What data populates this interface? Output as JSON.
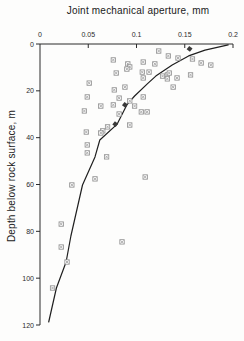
{
  "chart_data": {
    "type": "scatter",
    "title": "Joint mechanical aperture,  mm",
    "xlabel": "Joint mechanical aperture, mm",
    "ylabel": "Depth below rock surface,  m",
    "xlim": [
      0,
      0.2
    ],
    "ylim": [
      0,
      120
    ],
    "x_axis_position": "top",
    "y_axis_inverted": true,
    "grid": false,
    "legend": null,
    "x_ticks": [
      0,
      0.05,
      0.1,
      0.15,
      0.2
    ],
    "x_tick_labels": [
      "0",
      "0.05",
      "0.1",
      "0.15",
      "0.2"
    ],
    "y_ticks": [
      0,
      20,
      40,
      60,
      80,
      100,
      120
    ],
    "y_tick_labels": [
      "0",
      "20",
      "40",
      "60",
      "80",
      "100",
      "120"
    ],
    "style": {
      "axis_color": "#2b2b2b",
      "tick_label_color": "#2b2b2b",
      "marker_color": "#8f8f8f",
      "marker_fill": "#ffffff",
      "dark_marker_color": "#3a3a3a",
      "curve_color": "#1f1f1f",
      "background": "#fdfdfc"
    },
    "series": [
      {
        "name": "measured-aperture-points",
        "marker": "crossed-square",
        "points": [
          [
            0.123,
            3.0
          ],
          [
            0.133,
            5.1
          ],
          [
            0.143,
            6.0
          ],
          [
            0.158,
            6.4
          ],
          [
            0.167,
            8.1
          ],
          [
            0.177,
            9.0
          ],
          [
            0.156,
            13.2
          ],
          [
            0.076,
            6.8
          ],
          [
            0.091,
            8.5
          ],
          [
            0.093,
            9.8
          ],
          [
            0.09,
            10.7
          ],
          [
            0.107,
            7.7
          ],
          [
            0.119,
            8.5
          ],
          [
            0.079,
            12.4
          ],
          [
            0.106,
            12.0
          ],
          [
            0.113,
            12.0
          ],
          [
            0.107,
            14.5
          ],
          [
            0.127,
            13.7
          ],
          [
            0.132,
            13.2
          ],
          [
            0.134,
            12.4
          ],
          [
            0.132,
            14.9
          ],
          [
            0.142,
            14.5
          ],
          [
            0.051,
            16.7
          ],
          [
            0.088,
            18.4
          ],
          [
            0.077,
            19.6
          ],
          [
            0.138,
            18.4
          ],
          [
            0.049,
            22.6
          ],
          [
            0.082,
            23.1
          ],
          [
            0.093,
            24.3
          ],
          [
            0.107,
            22.6
          ],
          [
            0.063,
            26.5
          ],
          [
            0.076,
            26.0
          ],
          [
            0.098,
            26.5
          ],
          [
            0.046,
            28.6
          ],
          [
            0.105,
            29.0
          ],
          [
            0.111,
            29.0
          ],
          [
            0.082,
            29.9
          ],
          [
            0.065,
            37.1
          ],
          [
            0.07,
            35.4
          ],
          [
            0.093,
            34.6
          ],
          [
            0.048,
            37.6
          ],
          [
            0.063,
            38.0
          ],
          [
            0.049,
            43.1
          ],
          [
            0.049,
            46.5
          ],
          [
            0.069,
            48.2
          ],
          [
            0.109,
            56.8
          ],
          [
            0.057,
            57.6
          ],
          [
            0.033,
            60.2
          ],
          [
            0.022,
            76.9
          ],
          [
            0.085,
            84.5
          ],
          [
            0.022,
            86.7
          ],
          [
            0.028,
            93.1
          ],
          [
            0.013,
            104.2
          ]
        ]
      },
      {
        "name": "curve-anchor-points",
        "marker": "filled-square",
        "points": [
          [
            0.155,
            2.1
          ],
          [
            0.088,
            26.0
          ],
          [
            0.078,
            34.2
          ]
        ]
      }
    ],
    "fit_curve": {
      "name": "aperture-depth-fit-curve",
      "points": [
        [
          0.009,
          118.7
        ],
        [
          0.017,
          104.2
        ],
        [
          0.027,
          93.1
        ],
        [
          0.032,
          82.0
        ],
        [
          0.044,
          60.2
        ],
        [
          0.057,
          48.2
        ],
        [
          0.062,
          41.0
        ],
        [
          0.08,
          34.2
        ],
        [
          0.09,
          26.0
        ],
        [
          0.098,
          22.2
        ],
        [
          0.112,
          16.7
        ],
        [
          0.12,
          13.7
        ],
        [
          0.137,
          9.0
        ],
        [
          0.154,
          5.1
        ],
        [
          0.171,
          2.6
        ],
        [
          0.195,
          0.4
        ]
      ]
    }
  }
}
